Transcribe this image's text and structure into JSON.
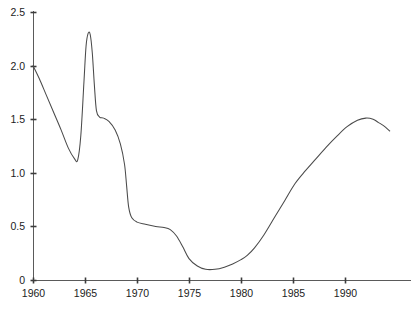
{
  "chart_data": {
    "type": "line",
    "title": "",
    "subtitle": "",
    "xlabel": "",
    "ylabel": "",
    "xlim": [
      1959.0,
      1994.3
    ],
    "ylim": [
      0,
      2.5
    ],
    "grid": false,
    "legend": null,
    "xticks": [
      1960,
      1965,
      1970,
      1975,
      1980,
      1985,
      1990
    ],
    "xtick_labels": [
      "1960",
      "1965",
      "1970",
      "1975",
      "1980",
      "1985",
      "1990"
    ],
    "yticks": [
      0,
      0.5,
      1.0,
      1.5,
      2.0,
      2.5
    ],
    "ytick_labels": [
      "0",
      "0.5",
      "1.0",
      "1.5",
      "2.0",
      "2.5"
    ],
    "line_color": "#4a4a4a",
    "axis_color": "#5a5a5a",
    "series": [
      {
        "name": "series-1",
        "x": [
          1960.0,
          1960.6,
          1961.3,
          1962.0,
          1962.7,
          1963.4,
          1964.0,
          1964.3,
          1964.6,
          1964.9,
          1965.1,
          1965.3,
          1965.5,
          1965.7,
          1965.9,
          1966.1,
          1966.4,
          1966.8,
          1967.3,
          1967.9,
          1968.4,
          1968.8,
          1969.0,
          1969.2,
          1969.5,
          1970.0,
          1970.8,
          1971.8,
          1972.6,
          1973.2,
          1973.8,
          1974.4,
          1975.0,
          1975.8,
          1976.6,
          1977.5,
          1978.4,
          1979.2,
          1980.0,
          1980.6,
          1981.3,
          1982.2,
          1983.2,
          1984.2,
          1985.2,
          1986.2,
          1987.2,
          1988.2,
          1989.2,
          1990.2,
          1991.2,
          1992.0,
          1992.7,
          1993.2,
          1993.7,
          1994.3
        ],
        "y": [
          2.0,
          1.88,
          1.72,
          1.56,
          1.4,
          1.23,
          1.13,
          1.12,
          1.35,
          1.85,
          2.18,
          2.3,
          2.29,
          2.12,
          1.82,
          1.58,
          1.52,
          1.51,
          1.48,
          1.4,
          1.27,
          1.08,
          0.88,
          0.68,
          0.58,
          0.54,
          0.52,
          0.5,
          0.49,
          0.47,
          0.41,
          0.31,
          0.2,
          0.13,
          0.1,
          0.1,
          0.12,
          0.15,
          0.19,
          0.23,
          0.3,
          0.42,
          0.58,
          0.74,
          0.9,
          1.02,
          1.13,
          1.24,
          1.34,
          1.43,
          1.49,
          1.51,
          1.5,
          1.47,
          1.44,
          1.39
        ]
      }
    ],
    "annotations": {
      "initial_value_1960": 2.0,
      "local_min_1964": 1.12,
      "peak_1965": 2.3,
      "shelf_1967": 1.51,
      "plateau_1972": 0.5,
      "global_min_1976": 0.1,
      "final_peak_1992": 1.51,
      "end_value": 1.39
    }
  },
  "geometry": {
    "plot_left": 33,
    "plot_right": 400,
    "plot_bottom": 280,
    "plot_top": 12,
    "px_per_year": 10.4,
    "px_per_unit": 107.2
  }
}
